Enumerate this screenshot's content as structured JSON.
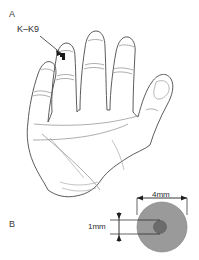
{
  "figure": {
    "background_color": "#ffffff",
    "panels": [
      {
        "id": "A",
        "letter": "A",
        "description": "line drawing of a left hand palm with four extended fingers and thumb",
        "annotation": {
          "label": "K–K9",
          "icon": "arrow-pointer-icon",
          "target": "marker patch on index finger"
        }
      },
      {
        "id": "B",
        "letter": "B",
        "description": "gray disc electrode with dark central contact and dimension callouts",
        "dimensions": [
          {
            "name": "outer-diameter",
            "label": "4mm",
            "orientation": "horizontal"
          },
          {
            "name": "inner-diameter",
            "label": "1mm",
            "orientation": "vertical"
          }
        ]
      }
    ]
  },
  "colors": {
    "outline": "#4a4a4a",
    "crease": "#8a8a8a",
    "marker": "#1a1a1a",
    "disc_outer": "#9a9a9a",
    "disc_inner": "#6b6b6b",
    "dimension_line": "#1f1f1f",
    "text": "#2e2e2e"
  }
}
